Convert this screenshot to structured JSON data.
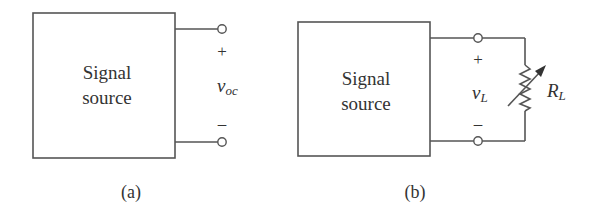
{
  "figure": {
    "panels": [
      {
        "id": "a",
        "caption": "(a)",
        "block": {
          "line1": "Signal",
          "line2": "source"
        },
        "polarity": {
          "plus": "+",
          "minus": "–"
        },
        "voltage": {
          "symbol": "v",
          "subscript": "oc"
        }
      },
      {
        "id": "b",
        "caption": "(b)",
        "block": {
          "line1": "Signal",
          "line2": "source"
        },
        "polarity": {
          "plus": "+",
          "minus": "–"
        },
        "voltage": {
          "symbol": "v",
          "subscript": "L"
        },
        "load": {
          "symbol": "R",
          "subscript": "L",
          "type": "variable-resistor"
        }
      }
    ]
  },
  "colors": {
    "line": "#555555",
    "text": "#333333",
    "background": "#ffffff"
  }
}
